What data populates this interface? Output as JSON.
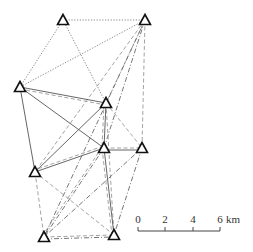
{
  "diagram": {
    "type": "triangulation-network",
    "stations": [
      {
        "id": "S1",
        "x": 63,
        "y": 20
      },
      {
        "id": "S2",
        "x": 145,
        "y": 20
      },
      {
        "id": "S3",
        "x": 20,
        "y": 87
      },
      {
        "id": "S4",
        "x": 106,
        "y": 103
      },
      {
        "id": "S5",
        "x": 104,
        "y": 148
      },
      {
        "id": "S6",
        "x": 142,
        "y": 148
      },
      {
        "id": "S7",
        "x": 35,
        "y": 172
      },
      {
        "id": "S8",
        "x": 44,
        "y": 237
      },
      {
        "id": "S9",
        "x": 114,
        "y": 235
      }
    ],
    "line_styles": {
      "solid": {
        "color": "#555555",
        "dash": ""
      },
      "dotted": {
        "color": "#777777",
        "dash": "1.2,1.6"
      },
      "dashed": {
        "color": "#999999",
        "dash": "4,2.5"
      },
      "dashdot": {
        "color": "#666666",
        "dash": "5,2,1,2"
      }
    },
    "edges": [
      {
        "a": "S1",
        "b": "S2",
        "style": "dotted"
      },
      {
        "a": "S1",
        "b": "S3",
        "style": "dotted"
      },
      {
        "a": "S1",
        "b": "S4",
        "style": "dotted"
      },
      {
        "a": "S2",
        "b": "S3",
        "style": "dotted"
      },
      {
        "a": "S2",
        "b": "S4",
        "style": "dashed"
      },
      {
        "a": "S2",
        "b": "S5",
        "style": "dashdot"
      },
      {
        "a": "S2",
        "b": "S6",
        "style": "dashed"
      },
      {
        "a": "S2",
        "b": "S7",
        "style": "dashed"
      },
      {
        "a": "S2",
        "b": "S8",
        "style": "dashdot"
      },
      {
        "a": "S3",
        "b": "S4",
        "style": "solid"
      },
      {
        "a": "S3",
        "b": "S4",
        "style": "dashed",
        "offset": 2
      },
      {
        "a": "S3",
        "b": "S5",
        "style": "solid"
      },
      {
        "a": "S3",
        "b": "S7",
        "style": "solid"
      },
      {
        "a": "S4",
        "b": "S5",
        "style": "solid"
      },
      {
        "a": "S4",
        "b": "S5",
        "style": "dashed",
        "offset": 2
      },
      {
        "a": "S4",
        "b": "S7",
        "style": "solid"
      },
      {
        "a": "S4",
        "b": "S6",
        "style": "dashed"
      },
      {
        "a": "S4",
        "b": "S9",
        "style": "dashed"
      },
      {
        "a": "S5",
        "b": "S6",
        "style": "dashed"
      },
      {
        "a": "S5",
        "b": "S6",
        "style": "solid",
        "offset": 2
      },
      {
        "a": "S5",
        "b": "S7",
        "style": "solid"
      },
      {
        "a": "S5",
        "b": "S7",
        "style": "dashed",
        "offset": 2
      },
      {
        "a": "S5",
        "b": "S8",
        "style": "dashdot"
      },
      {
        "a": "S5",
        "b": "S8",
        "style": "dashed",
        "offset": 2
      },
      {
        "a": "S5",
        "b": "S9",
        "style": "solid"
      },
      {
        "a": "S5",
        "b": "S9",
        "style": "dashed",
        "offset": 2
      },
      {
        "a": "S6",
        "b": "S8",
        "style": "dashdot"
      },
      {
        "a": "S6",
        "b": "S9",
        "style": "dashdot"
      },
      {
        "a": "S7",
        "b": "S8",
        "style": "dashed"
      },
      {
        "a": "S7",
        "b": "S9",
        "style": "dashed"
      },
      {
        "a": "S8",
        "b": "S9",
        "style": "dashed"
      },
      {
        "a": "S8",
        "b": "S9",
        "style": "dashdot",
        "offset": 2
      }
    ]
  },
  "scale_bar": {
    "x0": 138,
    "x1": 220,
    "y": 231,
    "ticks": [
      {
        "label": "0",
        "x": 138
      },
      {
        "label": "2",
        "x": 165
      },
      {
        "label": "4",
        "x": 193
      },
      {
        "label": "6",
        "x": 220
      }
    ],
    "unit": "km"
  }
}
